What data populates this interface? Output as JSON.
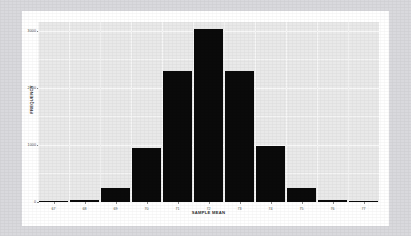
{
  "chart_data": {
    "type": "bar",
    "title": "",
    "subtitle": "",
    "xlabel": "SAMPLE MEAN",
    "ylabel": "FREQUENCY",
    "categories": [
      "67",
      "68",
      "69",
      "70",
      "71",
      "72",
      "73",
      "74",
      "75",
      "76",
      "77"
    ],
    "values": [
      5,
      30,
      250,
      950,
      2300,
      3020,
      2300,
      980,
      250,
      30,
      5
    ],
    "ytick_labels": [
      "0",
      "1000",
      "2000",
      "3000"
    ],
    "ytick_values": [
      0,
      1000,
      2000,
      3000
    ],
    "ylim": [
      0,
      3150
    ],
    "xlim": [
      66.5,
      77.5
    ],
    "grid": true,
    "legend": null,
    "bar_color": "#0a0a0a",
    "panel_color": "#e9e9e9",
    "gridline_color": "#ffffff",
    "page_background": "#d9d9dd",
    "card_background": "#ffffff",
    "axis_text_color": "#4a4a4a"
  }
}
